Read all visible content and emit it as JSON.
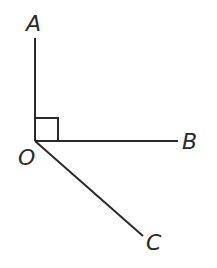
{
  "diagram": {
    "type": "geometry-angles",
    "colors": {
      "stroke": "#2a2a2a",
      "background": "#ffffff"
    },
    "points": {
      "O": {
        "label": "O",
        "x": 35,
        "y": 141
      },
      "A": {
        "label": "A",
        "x": 35,
        "y": 38
      },
      "B": {
        "label": "B",
        "x": 178,
        "y": 141
      },
      "C": {
        "label": "C",
        "x": 143,
        "y": 236
      }
    },
    "labels": {
      "A": "A",
      "B": "B",
      "C": "C",
      "O": "O"
    },
    "right_angle_marker": {
      "at": "O",
      "between": [
        "OA",
        "OB"
      ],
      "size": 23
    },
    "segments": [
      {
        "name": "OA",
        "from": "O",
        "to": "A"
      },
      {
        "name": "OB",
        "from": "O",
        "to": "B"
      },
      {
        "name": "OC",
        "from": "O",
        "to": "C"
      }
    ]
  }
}
